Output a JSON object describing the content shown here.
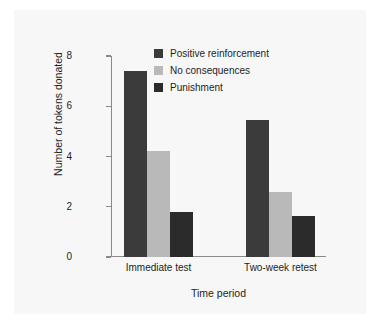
{
  "chart_data": {
    "type": "bar",
    "title": "",
    "subtitle": "",
    "xlabel": "Time period",
    "ylabel": "Number of tokens donated",
    "categories": [
      "Immediate test",
      "Two-week retest"
    ],
    "series": [
      {
        "name": "Positive reinforcement",
        "color": "#3b3b3b",
        "values": [
          7.4,
          5.45
        ]
      },
      {
        "name": "No consequences",
        "color": "#b9b9b9",
        "values": [
          4.2,
          2.6
        ]
      },
      {
        "name": "Punishment",
        "color": "#2b2b2b",
        "values": [
          1.8,
          1.65
        ]
      }
    ],
    "ylim": [
      0,
      8
    ],
    "yticks": [
      0,
      2,
      4,
      6,
      8
    ],
    "ytick_labels": [
      "0",
      "2",
      "4",
      "6",
      "8"
    ],
    "grid": false,
    "legend_position": "top-center",
    "background_color": "#f7f7f8",
    "axis_color": "#8a8a8a",
    "text_color": "#1d1d1d"
  }
}
